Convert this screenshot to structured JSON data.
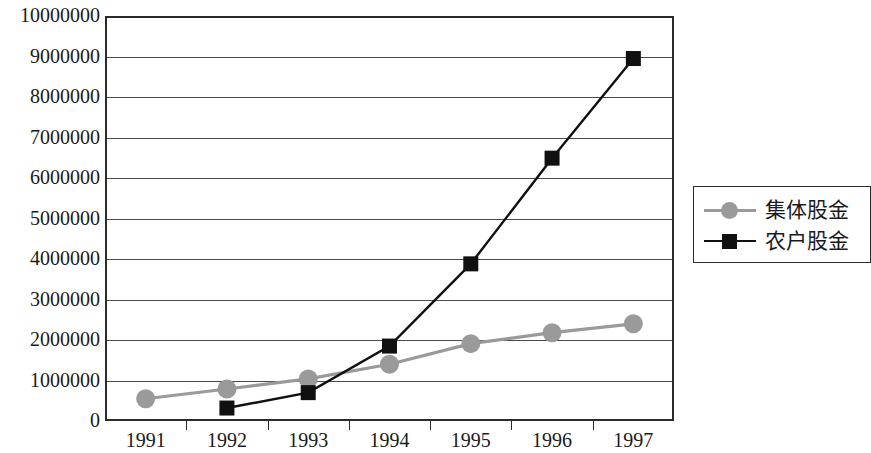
{
  "chart_data": {
    "type": "line",
    "title": "",
    "xlabel": "",
    "ylabel": "",
    "categories": [
      "1991",
      "1992",
      "1993",
      "1994",
      "1995",
      "1996",
      "1997"
    ],
    "ylim": [
      0,
      10000000
    ],
    "y_ticks": [
      0,
      1000000,
      2000000,
      3000000,
      4000000,
      5000000,
      6000000,
      7000000,
      8000000,
      9000000,
      10000000
    ],
    "y_tick_labels": [
      "0",
      "1000000",
      "2000000",
      "3000000",
      "4000000",
      "5000000",
      "6000000",
      "7000000",
      "8000000",
      "9000000",
      "10000000"
    ],
    "grid": true,
    "legend_position": "right",
    "series": [
      {
        "name": "集体股金",
        "marker": "circle",
        "color": "#9a9a9a",
        "values": [
          550000,
          790000,
          1040000,
          1400000,
          1910000,
          2180000,
          2400000
        ]
      },
      {
        "name": "农户股金",
        "marker": "square",
        "color": "#101010",
        "values": [
          null,
          320000,
          700000,
          1850000,
          3880000,
          6490000,
          8950000
        ]
      }
    ]
  },
  "legend": {
    "items": [
      {
        "label": "集体股金",
        "marker": "circle-marker-icon"
      },
      {
        "label": "农户股金",
        "marker": "square-marker-icon"
      }
    ]
  }
}
